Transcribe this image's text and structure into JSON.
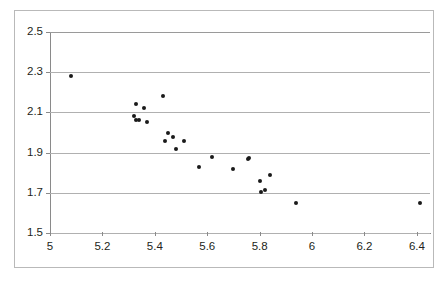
{
  "chart_data": {
    "type": "scatter",
    "title": "",
    "subtitle": "",
    "xlabel": "",
    "ylabel": "",
    "xlim": [
      5.0,
      6.45
    ],
    "ylim": [
      1.5,
      2.5
    ],
    "xticks": [
      "5",
      "5.2",
      "5.4",
      "5.6",
      "5.8",
      "6",
      "6.2",
      "6.4"
    ],
    "xtick_values": [
      5.0,
      5.2,
      5.4,
      5.6,
      5.8,
      6.0,
      6.2,
      6.4
    ],
    "yticks": [
      "2.5",
      "2.3",
      "2.1",
      "1.9",
      "1.7",
      "1.5"
    ],
    "ytick_values": [
      2.5,
      2.3,
      2.1,
      1.9,
      1.7,
      1.5
    ],
    "grid": "horizontal",
    "legend": "none",
    "marker_color": "#1a1a1a",
    "gridline_color": "#b0b0b0",
    "axis_color": "#8a8a8a",
    "series": [
      {
        "name": "data",
        "points": [
          [
            5.08,
            2.28
          ],
          [
            5.32,
            2.08
          ],
          [
            5.33,
            2.14
          ],
          [
            5.33,
            2.06
          ],
          [
            5.34,
            2.06
          ],
          [
            5.36,
            2.12
          ],
          [
            5.37,
            2.05
          ],
          [
            5.43,
            2.18
          ],
          [
            5.45,
            2.0
          ],
          [
            5.44,
            1.96
          ],
          [
            5.47,
            1.98
          ],
          [
            5.48,
            1.92
          ],
          [
            5.51,
            1.96
          ],
          [
            5.57,
            1.83
          ],
          [
            5.62,
            1.88
          ],
          [
            5.7,
            1.82
          ],
          [
            5.755,
            1.87
          ],
          [
            5.76,
            1.875
          ],
          [
            5.8,
            1.76
          ],
          [
            5.805,
            1.705
          ],
          [
            5.82,
            1.715
          ],
          [
            5.84,
            1.79
          ],
          [
            5.94,
            1.65
          ],
          [
            6.41,
            1.65
          ]
        ]
      }
    ]
  }
}
